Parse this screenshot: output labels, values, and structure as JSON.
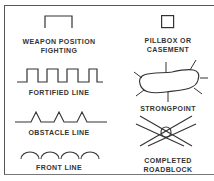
{
  "legend": {
    "items": [
      {
        "id": "weapon-position",
        "label_line1": "WEAPON POSITION",
        "label_line2": "FIGHTING"
      },
      {
        "id": "pillbox",
        "label_line1": "PILLBOX OR",
        "label_line2": "CASEMENT"
      },
      {
        "id": "fortified-line",
        "label_line1": "FORTIFIED LINE"
      },
      {
        "id": "strongpoint",
        "label_line1": "STRONGPOINT"
      },
      {
        "id": "obstacle-line",
        "label_line1": "OBSTACLE LINE"
      },
      {
        "id": "completed-roadblock",
        "label_line1": "COMPLETED",
        "label_line2": "ROADBLOCK"
      },
      {
        "id": "front-line",
        "label_line1": "FRONT LINE"
      }
    ]
  },
  "colors": {
    "stroke": "#333333",
    "text": "#333333",
    "background": "#ffffff"
  }
}
